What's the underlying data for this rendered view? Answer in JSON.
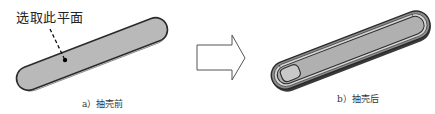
{
  "figure": {
    "callout_text": "选取此平面",
    "panels": [
      {
        "id": "a",
        "caption": "a）抽壳前",
        "description": "solid capsule-shaped plate before shell"
      },
      {
        "id": "b",
        "caption": "b）抽壳后",
        "description": "capsule-shaped plate after shell with thin walls"
      }
    ],
    "arrow": {
      "direction": "right",
      "style": "hollow-block-arrow"
    },
    "colors": {
      "face_fill": "#b9b9b9",
      "outline": "#2a2a2a",
      "rim_fill": "#8c8c8c",
      "inner_fill": "#b0b0b0",
      "arrow_stroke": "#555555",
      "background": "#ffffff"
    }
  }
}
